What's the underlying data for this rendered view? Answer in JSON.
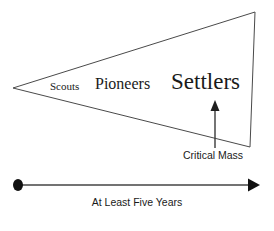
{
  "diagram": {
    "stages": [
      {
        "id": "scouts",
        "label": "Scouts"
      },
      {
        "id": "pioneers",
        "label": "Pioneers"
      },
      {
        "id": "settlers",
        "label": "Settlers"
      }
    ],
    "annotations": {
      "critical_mass": "Critical Mass",
      "timeline": "At Least Five Years"
    },
    "colors": {
      "background": "#ffffff",
      "stroke": "#4a4a4a",
      "text": "#1a1a1a",
      "timeline": "#444444"
    },
    "geometry": {
      "apex": [
        13,
        88
      ],
      "top_right": [
        255,
        12
      ],
      "bottom_right": [
        250,
        147
      ],
      "right_edge_label": "wedge-right-edge",
      "callout_arrow": {
        "x": 215,
        "y_start": 148,
        "y_end": 101
      },
      "timeline_axis": {
        "x_start": 18,
        "x_end": 258,
        "y": 185
      }
    }
  }
}
